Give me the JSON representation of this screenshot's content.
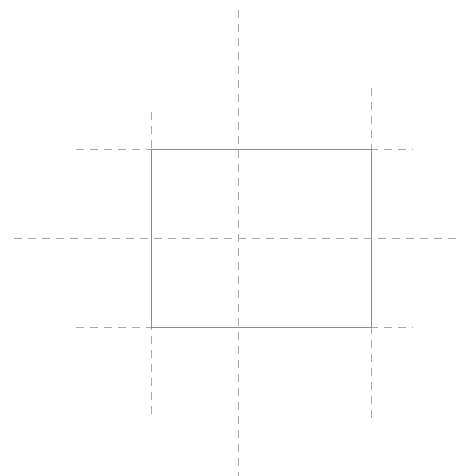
{
  "canvas": {
    "width": 468,
    "height": 476,
    "background_color": "#ffffff",
    "title": "Rectangle with construction guide lines"
  },
  "style": {
    "solid_stroke_color": "#8c8c8c",
    "dashed_stroke_color": "#a8a8a8",
    "stroke_width": 1,
    "dash_pattern": "8 6",
    "shape_fill": "none"
  },
  "shapes": [
    {
      "id": "main-rectangle",
      "type": "rect",
      "stroke_style": "solid",
      "x": 151,
      "y": 149,
      "width": 220,
      "height": 178,
      "left": 151,
      "right": 371,
      "top": 149,
      "bottom": 327,
      "center_x": 261,
      "center_y": 238
    }
  ],
  "guides": [
    {
      "id": "guide-vertical-center",
      "type": "vertical",
      "orientation": "vertical",
      "x": 238,
      "y1": 10,
      "y2": 476,
      "role": "center-axis"
    },
    {
      "id": "guide-vertical-left",
      "type": "vertical",
      "orientation": "vertical",
      "x": 151,
      "y1": 112,
      "y2": 419,
      "role": "rectangle-left-edge-extension"
    },
    {
      "id": "guide-vertical-right",
      "type": "vertical",
      "orientation": "vertical",
      "x": 371,
      "y1": 88,
      "y2": 419,
      "role": "rectangle-right-edge-extension"
    },
    {
      "id": "guide-horizontal-center",
      "type": "horizontal",
      "orientation": "horizontal",
      "y": 238,
      "x1": 14,
      "x2": 456,
      "role": "center-axis"
    },
    {
      "id": "guide-horizontal-top",
      "type": "horizontal",
      "orientation": "horizontal",
      "y": 149,
      "x1": 76,
      "x2": 413,
      "role": "rectangle-top-edge-extension"
    },
    {
      "id": "guide-horizontal-bottom",
      "type": "horizontal",
      "orientation": "horizontal",
      "y": 327,
      "x1": 76,
      "x2": 413,
      "role": "rectangle-bottom-edge-extension"
    }
  ]
}
